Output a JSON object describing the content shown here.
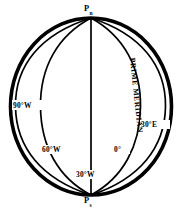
{
  "figure": {
    "name": "globe-meridians-diagram",
    "stroke_color": "#000000",
    "background_color": "#ffffff"
  },
  "poles": {
    "north": {
      "symbol": "P",
      "subscript": "n"
    },
    "south": {
      "symbol": "P",
      "subscript": "s"
    }
  },
  "meridian_labels": [
    {
      "id": "ninety-west",
      "text": "90°W"
    },
    {
      "id": "sixty-west",
      "text": "60°W"
    },
    {
      "id": "thirty-west",
      "text": "30°W"
    },
    {
      "id": "zero-degrees",
      "text": "0°"
    },
    {
      "id": "thirty-east",
      "text": "30°E"
    }
  ],
  "annotations": {
    "prime_meridian": "PRIME MERIDIAN"
  }
}
